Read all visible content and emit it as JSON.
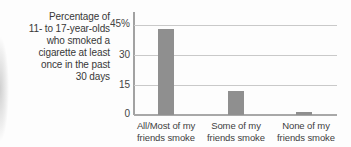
{
  "chart_data": {
    "type": "bar",
    "title": "",
    "ylabel": "Percentage of 11- to 17-year-olds who smoked a cigarette at least once in the past 30 days",
    "xlabel": "",
    "categories": [
      "All/Most of my friends smoke",
      "Some of my friends smoke",
      "None of my friends smoke"
    ],
    "values": [
      43,
      12,
      1.5
    ],
    "ylim": [
      0,
      45
    ],
    "yticks": [
      0,
      15,
      30,
      45
    ],
    "ytick_labels": [
      "0",
      "15",
      "30",
      "45%"
    ],
    "grid": true,
    "legend": false,
    "bar_color": "#8f8f8f"
  },
  "y_axis_title_lines": [
    "Percentage of",
    "11- to 17-year-olds",
    "who smoked a",
    "cigarette at least",
    "once in the past",
    "30 days"
  ],
  "y_tick_labels_top_down": [
    "45%",
    "30",
    "15",
    "0"
  ],
  "category_labels": [
    {
      "line1": "All/Most of my",
      "line2": "friends smoke"
    },
    {
      "line1": "Some of my",
      "line2": "friends smoke"
    },
    {
      "line1": "None of my",
      "line2": "friends smoke"
    }
  ],
  "colors": {
    "bar": "#8f8f8f",
    "gridline": "#c9c9c9",
    "baseline": "#a8a8a8",
    "axis_line": "#a2a2a2",
    "text": "#3a3a3a"
  }
}
